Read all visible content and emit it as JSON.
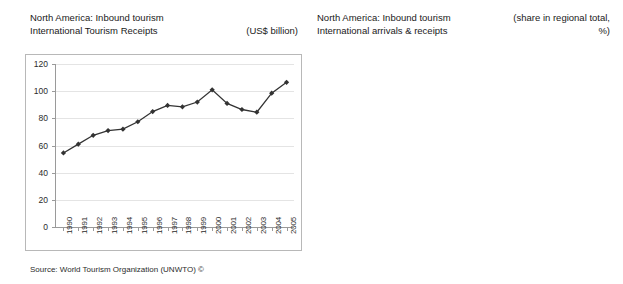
{
  "left_panel": {
    "title_line1": "North America: Inbound tourism",
    "title_line2": "International Tourism Receipts",
    "unit_note": "(US$ billion)",
    "source": "Source: World Tourism Organization (UNWTO) ©"
  },
  "right_panel": {
    "title_line1": "North America: Inbound tourism",
    "title_line2": "International arrivals & receipts",
    "unit_note_line1": "(share in regional total,",
    "unit_note_line2": "%)",
    "source": "Source: World Tourism Organization (UNWTO) ©"
  },
  "chart_data": [
    {
      "type": "line",
      "title": "North America: Inbound tourism — International Tourism Receipts",
      "xlabel": "",
      "ylabel": "(US$ billion)",
      "ylim": [
        0,
        120
      ],
      "yticks": [
        0,
        20,
        40,
        60,
        80,
        100,
        120
      ],
      "grid": true,
      "legend": "none",
      "x": [
        "1990",
        "1991",
        "1992",
        "1993",
        "1994",
        "1995",
        "1996",
        "1997",
        "1998",
        "1999",
        "2000",
        "2001",
        "2002",
        "2003",
        "2004",
        "2005"
      ],
      "values": [
        54.5,
        61.0,
        67.5,
        71.0,
        72.0,
        77.5,
        85.0,
        89.5,
        88.5,
        92.0,
        101.0,
        91.0,
        86.5,
        84.5,
        98.5,
        106.5
      ],
      "marker": "diamond",
      "line_color": "#333333"
    },
    {
      "type": "bar",
      "title": "North America: Inbound tourism — International arrivals & receipts",
      "xlabel": "",
      "ylabel": "(share in regional total, %)",
      "ylim": [
        0,
        90
      ],
      "yticks": [
        0,
        10,
        20,
        30,
        40,
        50,
        60,
        70,
        80,
        90
      ],
      "grid": true,
      "legend_position": "center-left-inside",
      "categories": [
        "International Tourist Arrivals",
        "International Tourism Receipts"
      ],
      "series": [
        {
          "name": "2000",
          "values": [
            71.4,
            77.6
          ],
          "color": "#d9d9d9"
        },
        {
          "name": "2005*",
          "values": [
            67.5,
            74.1
          ],
          "color": "#808080"
        }
      ],
      "data_labels": [
        "71.4",
        "67.5",
        "77.6",
        "74.1"
      ]
    }
  ]
}
